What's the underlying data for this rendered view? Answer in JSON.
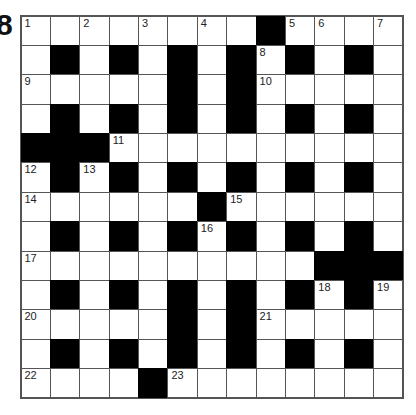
{
  "puzzle_number": "8",
  "grid": {
    "size": 13,
    "rows": [
      "........#....",
      ".#.#.#.#.#.#.",
      ".....#.#.....",
      ".#.#.#.#.#.#.",
      "###..........",
      ".#.#.#.#.#.#.",
      "......#......",
      ".#.#.#.#.#.#.",
      "..........###",
      ".#.#.#.#.#.#.",
      ".....#.#.....",
      ".#.#.#.#.#.#.",
      "....#........"
    ],
    "numbers": [
      {
        "r": 0,
        "c": 0,
        "n": "1"
      },
      {
        "r": 0,
        "c": 2,
        "n": "2"
      },
      {
        "r": 0,
        "c": 4,
        "n": "3"
      },
      {
        "r": 0,
        "c": 6,
        "n": "4"
      },
      {
        "r": 0,
        "c": 9,
        "n": "5"
      },
      {
        "r": 0,
        "c": 10,
        "n": "6"
      },
      {
        "r": 0,
        "c": 12,
        "n": "7"
      },
      {
        "r": 1,
        "c": 8,
        "n": "8"
      },
      {
        "r": 2,
        "c": 0,
        "n": "9"
      },
      {
        "r": 2,
        "c": 8,
        "n": "10"
      },
      {
        "r": 4,
        "c": 3,
        "n": "11"
      },
      {
        "r": 5,
        "c": 0,
        "n": "12"
      },
      {
        "r": 5,
        "c": 2,
        "n": "13"
      },
      {
        "r": 6,
        "c": 0,
        "n": "14"
      },
      {
        "r": 6,
        "c": 7,
        "n": "15"
      },
      {
        "r": 7,
        "c": 6,
        "n": "16"
      },
      {
        "r": 8,
        "c": 0,
        "n": "17"
      },
      {
        "r": 9,
        "c": 10,
        "n": "18"
      },
      {
        "r": 9,
        "c": 12,
        "n": "19"
      },
      {
        "r": 10,
        "c": 0,
        "n": "20"
      },
      {
        "r": 10,
        "c": 8,
        "n": "21"
      },
      {
        "r": 12,
        "c": 0,
        "n": "22"
      },
      {
        "r": 12,
        "c": 5,
        "n": "23"
      }
    ]
  }
}
